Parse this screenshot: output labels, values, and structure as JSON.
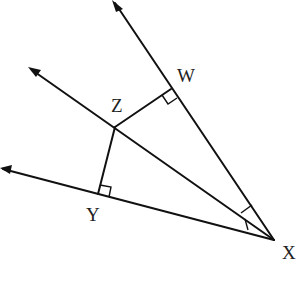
{
  "diagram": {
    "type": "geometry-angle-bisector",
    "points": {
      "X": {
        "label": "X",
        "x": 274,
        "y": 240
      },
      "W": {
        "label": "W",
        "x": 171,
        "y": 89
      },
      "Z": {
        "label": "Z",
        "x": 115,
        "y": 127
      },
      "Y": {
        "label": "Y",
        "x": 98,
        "y": 194
      }
    },
    "rays": [
      {
        "name": "ray-XW",
        "from": "X",
        "through": "W",
        "arrow": true
      },
      {
        "name": "ray-XZ",
        "from": "X",
        "through": "Z",
        "arrow": true
      },
      {
        "name": "ray-XY",
        "from": "X",
        "through": "Y",
        "arrow": true
      }
    ],
    "segments": [
      {
        "name": "segment-ZW",
        "from": "Z",
        "to": "W"
      },
      {
        "name": "segment-ZY",
        "from": "Z",
        "to": "Y"
      }
    ],
    "right_angle_marks": [
      "W",
      "Y"
    ],
    "congruent_angle_marks": [
      "angle-WXZ",
      "angle-ZXY"
    ],
    "labels": {
      "W": "W",
      "Z": "Z",
      "Y": "Y",
      "X": "X"
    },
    "colors": {
      "stroke": "#111111",
      "background": "#ffffff",
      "text": "#222222"
    }
  }
}
